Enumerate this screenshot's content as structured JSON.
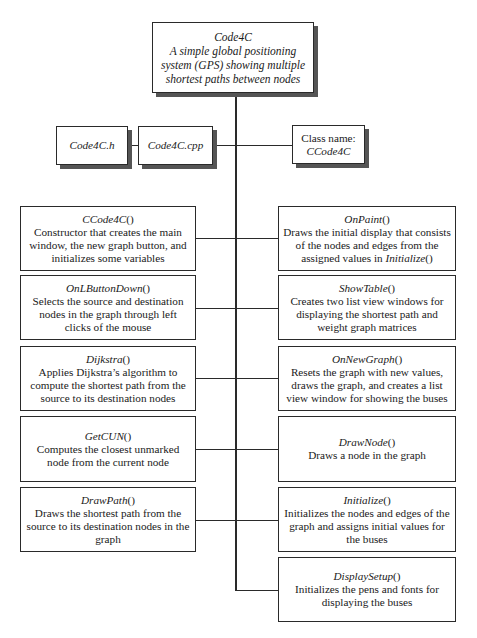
{
  "root": {
    "name": "Code4C",
    "lines": [
      "A simple global positioning",
      "system (GPS) showing multiple",
      "shortest paths between nodes"
    ]
  },
  "files": {
    "header": "Code4C.h",
    "source": "Code4C.cpp",
    "class_label": "Class name:",
    "class_name": "CCode4C"
  },
  "left_functions": [
    {
      "name": "CCode4C",
      "suffix": "()",
      "description": "Constructor that creates the main window, the new graph button, and initializes some variables"
    },
    {
      "name": "OnLButtonDown",
      "suffix": "()",
      "description": "Selects the source and destination nodes in the graph through left clicks of the mouse"
    },
    {
      "name": "Dijkstra",
      "suffix": "()",
      "description": "Applies Dijkstra’s algorithm to compute the shortest path from the source to its destination nodes"
    },
    {
      "name": "GetCUN",
      "suffix": "()",
      "description": "Computes the closest unmarked node from the current node"
    },
    {
      "name": "DrawPath",
      "suffix": "()",
      "description": "Draws the shortest path from the source to its destination nodes in the graph"
    }
  ],
  "right_functions": [
    {
      "name": "OnPaint",
      "suffix": "()",
      "description": "Draws the initial display that consists of the nodes and edges from the assigned values in ",
      "description_ref": "Initialize",
      "description_ref_suffix": "()"
    },
    {
      "name": "ShowTable",
      "suffix": "()",
      "description": "Creates two list view windows for displaying the shortest path and weight graph matrices"
    },
    {
      "name": "OnNewGraph",
      "suffix": "()",
      "description": "Resets the graph with new values, draws the graph, and creates a list view window for showing the buses"
    },
    {
      "name": "DrawNode",
      "suffix": "()",
      "description": "Draws a node in the graph"
    },
    {
      "name": "Initialize",
      "suffix": "()",
      "description": "Initializes the nodes and edges of the graph and assigns initial values for the buses"
    },
    {
      "name": "DisplaySetup",
      "suffix": "()",
      "description": "Initializes the pens and fonts for displaying the buses"
    }
  ],
  "colors": {
    "line": "#2a2a2a",
    "shadow": "#555555",
    "background": "#ffffff"
  }
}
